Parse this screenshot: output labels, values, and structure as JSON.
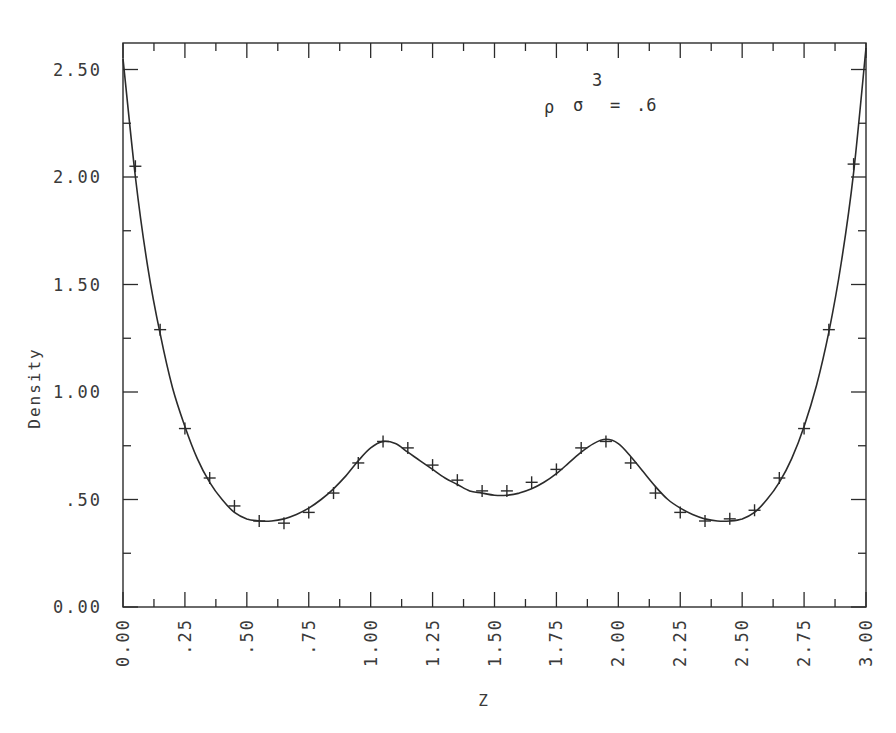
{
  "chart_data": {
    "type": "line",
    "title": "",
    "annotation": {
      "text": "ρ σ = .6",
      "superscript": "3",
      "parts": {
        "rho": "ρ",
        "sigma": "σ",
        "equals": "=",
        "value": ".6",
        "exponent": "3"
      }
    },
    "xlabel": "Z",
    "ylabel": "Density",
    "xlim": [
      0.0,
      3.0
    ],
    "ylim": [
      0.0,
      2.62
    ],
    "grid": false,
    "legend": "none",
    "x_ticks": [
      0.0,
      0.25,
      0.5,
      0.75,
      1.0,
      1.25,
      1.5,
      1.75,
      2.0,
      2.25,
      2.5,
      2.75,
      3.0
    ],
    "x_tick_labels": [
      "0.00",
      ".25",
      ".50",
      ".75",
      "1.00",
      "1.25",
      "1.50",
      "1.75",
      "2.00",
      "2.25",
      "2.50",
      "2.75",
      "3.00"
    ],
    "y_ticks": [
      0.0,
      0.5,
      1.0,
      1.5,
      2.0,
      2.5
    ],
    "y_tick_labels": [
      "0.00",
      ".50",
      "1.00",
      "1.50",
      "2.00",
      "2.50"
    ],
    "series": [
      {
        "name": "theory",
        "style": "solid-line",
        "x": [
          0.0,
          0.05,
          0.1,
          0.15,
          0.2,
          0.25,
          0.3,
          0.35,
          0.4,
          0.45,
          0.5,
          0.55,
          0.6,
          0.65,
          0.7,
          0.75,
          0.8,
          0.85,
          0.9,
          0.95,
          1.0,
          1.05,
          1.1,
          1.15,
          1.2,
          1.25,
          1.3,
          1.35,
          1.4,
          1.45,
          1.5,
          1.55,
          1.6,
          1.65,
          1.7,
          1.75,
          1.8,
          1.85,
          1.9,
          1.95,
          2.0,
          2.05,
          2.1,
          2.15,
          2.2,
          2.25,
          2.3,
          2.35,
          2.4,
          2.45,
          2.5,
          2.55,
          2.6,
          2.65,
          2.7,
          2.75,
          2.8,
          2.85,
          2.9,
          2.95,
          3.0
        ],
        "values": [
          2.55,
          2.0,
          1.58,
          1.27,
          1.02,
          0.84,
          0.69,
          0.58,
          0.5,
          0.44,
          0.41,
          0.4,
          0.4,
          0.41,
          0.43,
          0.46,
          0.5,
          0.55,
          0.61,
          0.68,
          0.74,
          0.77,
          0.76,
          0.72,
          0.68,
          0.64,
          0.6,
          0.57,
          0.54,
          0.53,
          0.52,
          0.52,
          0.53,
          0.55,
          0.58,
          0.62,
          0.67,
          0.72,
          0.76,
          0.78,
          0.76,
          0.7,
          0.63,
          0.56,
          0.5,
          0.46,
          0.43,
          0.41,
          0.4,
          0.4,
          0.41,
          0.44,
          0.5,
          0.58,
          0.69,
          0.84,
          1.03,
          1.28,
          1.6,
          2.02,
          2.6
        ]
      },
      {
        "name": "simulation",
        "style": "plus-markers",
        "x": [
          0.05,
          0.15,
          0.25,
          0.35,
          0.45,
          0.55,
          0.65,
          0.75,
          0.85,
          0.95,
          1.05,
          1.15,
          1.25,
          1.35,
          1.45,
          1.55,
          1.65,
          1.75,
          1.85,
          1.95,
          2.05,
          2.15,
          2.25,
          2.35,
          2.45,
          2.55,
          2.65,
          2.75,
          2.85,
          2.95
        ],
        "values": [
          2.05,
          1.29,
          0.83,
          0.6,
          0.47,
          0.4,
          0.39,
          0.44,
          0.53,
          0.67,
          0.77,
          0.74,
          0.66,
          0.59,
          0.54,
          0.54,
          0.58,
          0.64,
          0.74,
          0.77,
          0.67,
          0.53,
          0.44,
          0.4,
          0.41,
          0.45,
          0.6,
          0.83,
          1.29,
          2.06
        ]
      }
    ]
  },
  "colors": {
    "ink": "#2b2b2b",
    "label": "#3a3a3a",
    "background": "#ffffff"
  }
}
